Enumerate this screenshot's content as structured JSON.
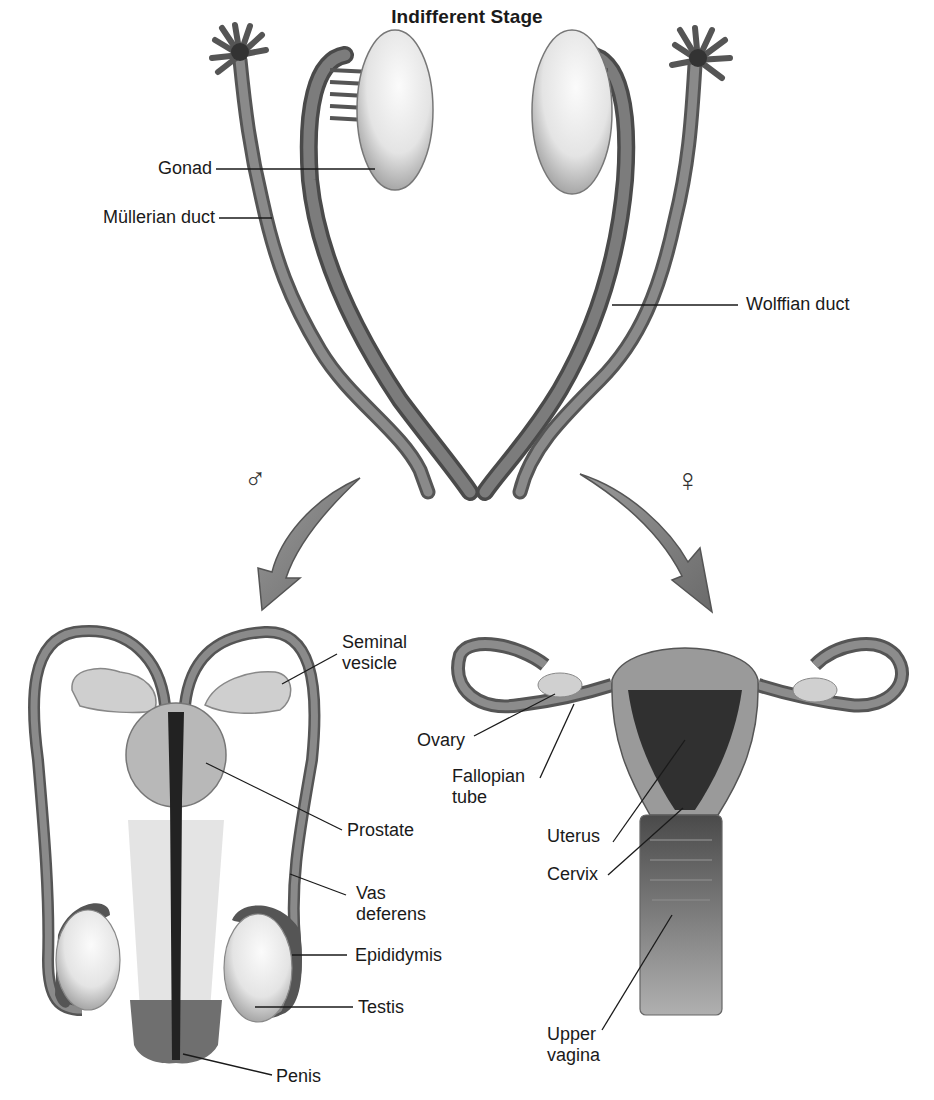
{
  "diagram": {
    "title": "Indifferent Stage",
    "indifferent_stage": {
      "labels": {
        "gonad": "Gonad",
        "mullerian_duct": "Müllerian duct",
        "wolffian_duct": "Wolffian duct"
      }
    },
    "branches": {
      "male": {
        "symbol": "♂",
        "icon": "male-symbol-icon"
      },
      "female": {
        "symbol": "♀",
        "icon": "female-symbol-icon"
      }
    },
    "male_system": {
      "labels": {
        "seminal_vesicle_1": "Seminal",
        "seminal_vesicle_2": "vesicle",
        "prostate": "Prostate",
        "vas_deferens_1": "Vas",
        "vas_deferens_2": "deferens",
        "epididymis": "Epididymis",
        "testis": "Testis",
        "penis": "Penis"
      }
    },
    "female_system": {
      "labels": {
        "ovary": "Ovary",
        "fallopian_tube_1": "Fallopian",
        "fallopian_tube_2": "tube",
        "uterus": "Uterus",
        "cervix": "Cervix",
        "upper_vagina_1": "Upper",
        "upper_vagina_2": "vagina"
      }
    },
    "colors": {
      "duct": "#6e6e6e",
      "duct_dark": "#3c3c3c",
      "organ_light": "#e6e6e6",
      "arrow": "#8a8a8a",
      "leader_line": "#1a1a1a"
    }
  }
}
